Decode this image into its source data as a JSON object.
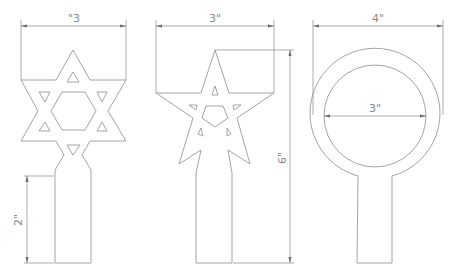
{
  "diagram": {
    "type": "technical-drawing",
    "units": "inches",
    "line_color": "#9a9a9a",
    "dimension_color": "#8a8a8a",
    "text_color": "#888888",
    "background": "#ffffff",
    "templates": [
      {
        "id": "star-of-david",
        "shape": "hexagram topper on rectangular stem",
        "dimensions": [
          {
            "label": "\"3",
            "orientation": "horizontal",
            "meaning": "overall width"
          },
          {
            "label": "2\"",
            "orientation": "vertical",
            "meaning": "stem height"
          }
        ]
      },
      {
        "id": "five-point-star",
        "shape": "pentagram topper on rectangular stem",
        "dimensions": [
          {
            "label": "3\"",
            "orientation": "horizontal",
            "meaning": "overall width"
          },
          {
            "label": "6\"",
            "orientation": "vertical",
            "meaning": "overall height"
          }
        ]
      },
      {
        "id": "ring",
        "shape": "circular ring topper on rectangular stem",
        "dimensions": [
          {
            "label": "4\"",
            "orientation": "horizontal",
            "meaning": "outer diameter"
          },
          {
            "label": "3\"",
            "orientation": "horizontal",
            "meaning": "inner diameter"
          }
        ]
      }
    ]
  }
}
